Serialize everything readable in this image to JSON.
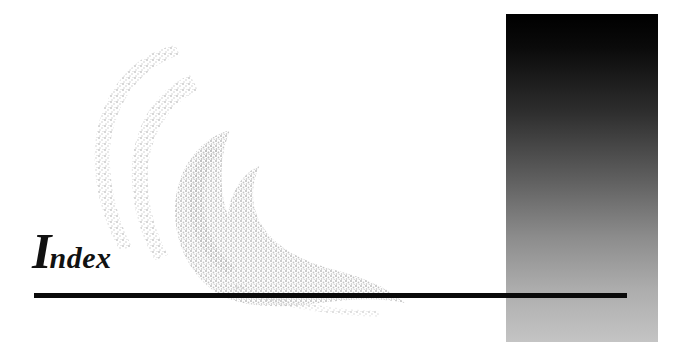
{
  "page": {
    "title_initial": "I",
    "title_rest": "ndex",
    "title_full": "Index"
  },
  "decor": {
    "gradient_panel": {
      "top_color": "#000000",
      "bottom_color": "#c4c4c4"
    },
    "swirl_color": "#c8c8c8",
    "rule_color": "#0a0a0a"
  }
}
